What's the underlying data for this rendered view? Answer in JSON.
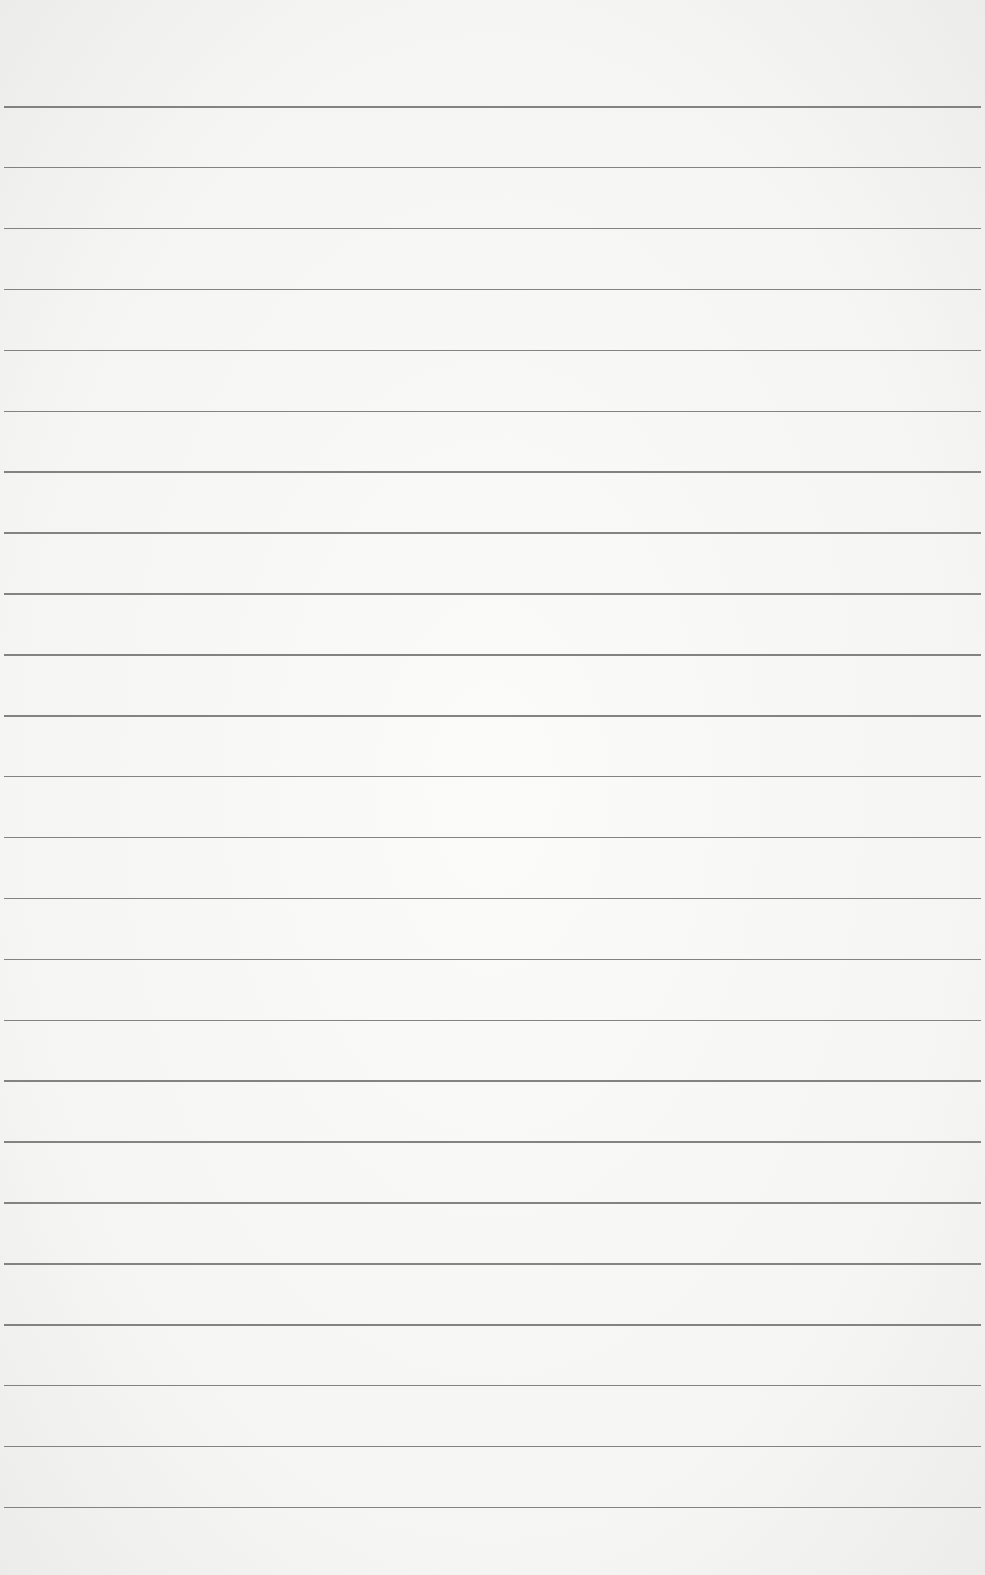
{
  "paper": {
    "background": "#f7f7f5",
    "line_color": "#6e6e6e",
    "line_count": 24,
    "first_line_y": 106,
    "line_spacing": 60.9,
    "text": []
  }
}
